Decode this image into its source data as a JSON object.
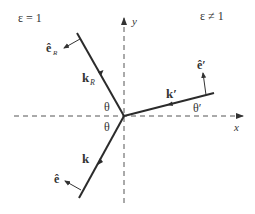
{
  "diagram": {
    "regions": {
      "left_label": "ε = 1",
      "right_label": "ε ≠ 1"
    },
    "axes": {
      "x_label": "x",
      "y_label": "y"
    },
    "rays": {
      "incident": "k",
      "reflected": "k",
      "reflected_sub": "R",
      "transmitted": "k′"
    },
    "polarization": {
      "incident": "ê",
      "reflected": "ê",
      "reflected_sub": "R",
      "transmitted": "ê′"
    },
    "angles": {
      "incident": "θ",
      "reflected": "θ",
      "transmitted": "θ′"
    },
    "colors": {
      "ray": "#2b2b2b",
      "axis": "#555555",
      "text": "#333333"
    }
  }
}
